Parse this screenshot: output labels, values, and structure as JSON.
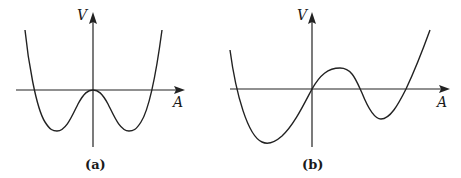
{
  "figure": {
    "panels": [
      {
        "id": "a",
        "caption": "(a)",
        "y_axis_label": "V",
        "x_axis_label": "A",
        "description": "Symmetric double-well potential: local maximum at the origin (V=0), two equal minima on either side, rising steeply at both ends."
      },
      {
        "id": "b",
        "caption": "(b)",
        "y_axis_label": "V",
        "x_axis_label": "A",
        "description": "Asymmetric potential passing through the origin: deep minimum at negative A, local maximum at small positive A, shallower local minimum at larger positive A, then rising."
      }
    ]
  },
  "colors": {
    "ink": "#222222",
    "background": "#ffffff"
  }
}
